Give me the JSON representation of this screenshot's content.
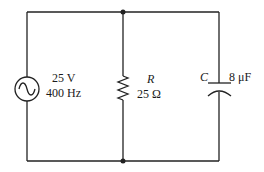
{
  "diagram": {
    "type": "circuit",
    "topology": "parallel RC driven by AC source",
    "source": {
      "symbol": "ac-voltage-source",
      "voltage": "25 V",
      "frequency": "400 Hz"
    },
    "resistor": {
      "symbol_label": "R",
      "value": "25 Ω"
    },
    "capacitor": {
      "symbol_label": "C",
      "value": "8 μF"
    },
    "junctions": 2,
    "colors": {
      "line": "#222222",
      "background": "#ffffff"
    }
  }
}
